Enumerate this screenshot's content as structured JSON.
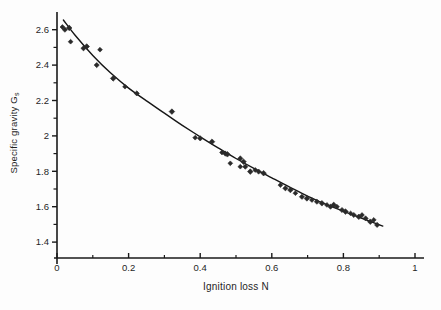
{
  "figure": {
    "background": "#fdfdfd",
    "ink": "#1f1f1f"
  },
  "chart_data": {
    "type": "scatter",
    "title": "",
    "xlabel": "Ignition loss N",
    "ylabel_main": "Specific gravity G",
    "ylabel_sub": "s",
    "xlim": [
      0,
      1
    ],
    "ylim": [
      1.31,
      2.7
    ],
    "grid": false,
    "legend": null,
    "x_major_ticks": [
      0,
      0.2,
      0.4,
      0.6,
      0.8,
      1
    ],
    "x_major_labels": [
      "0",
      "0.2",
      "0.4",
      "0.6",
      "0.8",
      "1"
    ],
    "x_minor_ticks": [
      0.1,
      0.3,
      0.5,
      0.7,
      0.9
    ],
    "y_major_ticks": [
      1.4,
      1.6,
      1.8,
      2,
      2.2,
      2.4,
      2.6
    ],
    "y_major_labels": [
      "1.4",
      "1.6",
      "1.8",
      "2",
      "2.2",
      "2.4",
      "2.6"
    ],
    "y_minor_ticks": [
      1.5,
      1.7,
      1.9,
      2.1,
      2.3,
      2.5
    ],
    "marker": "filled-diamond",
    "marker_color": "#2a2a2a",
    "line_color": "#161616",
    "axis_color": "#1a1a1a",
    "points": [
      [
        0.015,
        2.615
      ],
      [
        0.022,
        2.6
      ],
      [
        0.034,
        2.61
      ],
      [
        0.038,
        2.532
      ],
      [
        0.074,
        2.495
      ],
      [
        0.083,
        2.505
      ],
      [
        0.12,
        2.487
      ],
      [
        0.111,
        2.4
      ],
      [
        0.157,
        2.325
      ],
      [
        0.19,
        2.278
      ],
      [
        0.223,
        2.24
      ],
      [
        0.321,
        2.137
      ],
      [
        0.386,
        1.99
      ],
      [
        0.4,
        1.986
      ],
      [
        0.433,
        1.967
      ],
      [
        0.461,
        1.906
      ],
      [
        0.47,
        1.9
      ],
      [
        0.476,
        1.896
      ],
      [
        0.484,
        1.845
      ],
      [
        0.512,
        1.873
      ],
      [
        0.521,
        1.854
      ],
      [
        0.512,
        1.826
      ],
      [
        0.526,
        1.826
      ],
      [
        0.54,
        1.798
      ],
      [
        0.554,
        1.807
      ],
      [
        0.563,
        1.798
      ],
      [
        0.577,
        1.789
      ],
      [
        0.624,
        1.722
      ],
      [
        0.638,
        1.704
      ],
      [
        0.652,
        1.694
      ],
      [
        0.666,
        1.676
      ],
      [
        0.684,
        1.656
      ],
      [
        0.698,
        1.647
      ],
      [
        0.712,
        1.638
      ],
      [
        0.726,
        1.628
      ],
      [
        0.74,
        1.619
      ],
      [
        0.754,
        1.61
      ],
      [
        0.764,
        1.6
      ],
      [
        0.773,
        1.61
      ],
      [
        0.782,
        1.6
      ],
      [
        0.796,
        1.581
      ],
      [
        0.806,
        1.572
      ],
      [
        0.82,
        1.562
      ],
      [
        0.829,
        1.553
      ],
      [
        0.843,
        1.543
      ],
      [
        0.852,
        1.553
      ],
      [
        0.862,
        1.534
      ],
      [
        0.875,
        1.515
      ],
      [
        0.885,
        1.525
      ],
      [
        0.894,
        1.497
      ]
    ],
    "fit_curve": [
      [
        0.018,
        2.655
      ],
      [
        0.05,
        2.57
      ],
      [
        0.1,
        2.455
      ],
      [
        0.15,
        2.355
      ],
      [
        0.2,
        2.27
      ],
      [
        0.25,
        2.198
      ],
      [
        0.3,
        2.128
      ],
      [
        0.35,
        2.06
      ],
      [
        0.4,
        1.995
      ],
      [
        0.45,
        1.932
      ],
      [
        0.5,
        1.872
      ],
      [
        0.55,
        1.817
      ],
      [
        0.6,
        1.763
      ],
      [
        0.65,
        1.71
      ],
      [
        0.7,
        1.66
      ],
      [
        0.75,
        1.614
      ],
      [
        0.8,
        1.574
      ],
      [
        0.85,
        1.536
      ],
      [
        0.91,
        1.49
      ]
    ]
  }
}
